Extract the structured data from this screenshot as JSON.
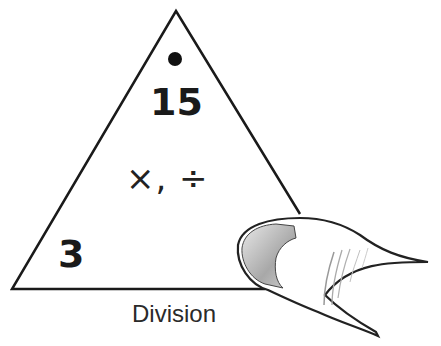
{
  "diagram": {
    "type": "fact-family-triangle",
    "top_number": "15",
    "top_marker": "dot",
    "bottom_left_number": "3",
    "bottom_right_number_covered_by": "thumb",
    "operations": "×, ÷",
    "caption": "Division"
  },
  "colors": {
    "stroke": "#1a1a1a",
    "background": "#ffffff",
    "thumbnail_shade": "#bdbdbd"
  }
}
